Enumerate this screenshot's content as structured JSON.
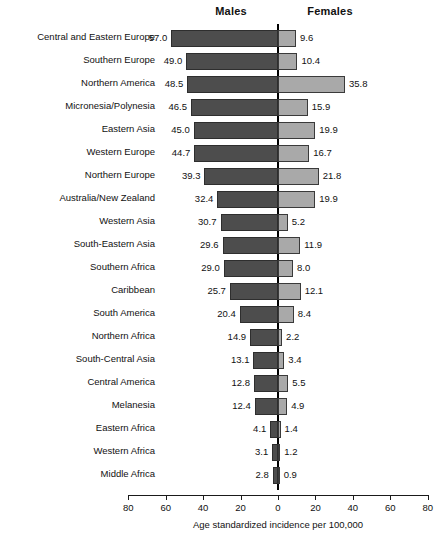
{
  "headers": {
    "males": "Males",
    "females": "Females"
  },
  "axis": {
    "title": "Age standardized incidence per 100,000",
    "tick_labels": [
      "80",
      "60",
      "40",
      "20",
      "0",
      "20",
      "40",
      "60",
      "80"
    ],
    "tick_values": [
      -80,
      -60,
      -40,
      -20,
      0,
      20,
      40,
      60,
      80
    ],
    "max": 80,
    "step": 20
  },
  "colors": {
    "male_bar": "#4d4d4d",
    "female_bar": "#a9a9a9",
    "bar_outline": "#2e2e2e",
    "axis": "#1a1a1a",
    "text": "#111111",
    "background": "#ffffff"
  },
  "chart_data": {
    "type": "bar",
    "title": "",
    "subtitle": "",
    "orientation": "horizontal",
    "layout": "diverging-population-pyramid",
    "xlabel": "Age standardized incidence per 100,000",
    "ylabel": "",
    "xlim": [
      -80,
      80
    ],
    "xticks": [
      -80,
      -60,
      -40,
      -20,
      0,
      20,
      40,
      60,
      80
    ],
    "xtick_labels": [
      "80",
      "60",
      "40",
      "20",
      "0",
      "20",
      "40",
      "60",
      "80"
    ],
    "grid": false,
    "legend_position": "top",
    "categories": [
      "Central and Eastern Europe",
      "Southern Europe",
      "Northern America",
      "Micronesia/Polynesia",
      "Eastern Asia",
      "Western Europe",
      "Northern Europe",
      "Australia/New Zealand",
      "Western Asia",
      "South-Eastern Asia",
      "Southern Africa",
      "Caribbean",
      "South America",
      "Northern Africa",
      "South-Central Asia",
      "Central America",
      "Melanesia",
      "Eastern Africa",
      "Western Africa",
      "Middle Africa"
    ],
    "series": [
      {
        "name": "Males",
        "side": "left",
        "values": [
          57.0,
          49.0,
          48.5,
          46.5,
          45.0,
          44.7,
          39.3,
          32.4,
          30.7,
          29.6,
          29.0,
          25.7,
          20.4,
          14.9,
          13.1,
          12.8,
          12.4,
          4.1,
          3.1,
          2.8
        ],
        "labels": [
          "57.0",
          "49.0",
          "48.5",
          "46.5",
          "45.0",
          "44.7",
          "39.3",
          "32.4",
          "30.7",
          "29.6",
          "29.0",
          "25.7",
          "20.4",
          "14.9",
          "13.1",
          "12.8",
          "12.4",
          "4.1",
          "3.1",
          "2.8"
        ]
      },
      {
        "name": "Females",
        "side": "right",
        "values": [
          9.6,
          10.4,
          35.8,
          15.9,
          19.9,
          16.7,
          21.8,
          19.9,
          5.2,
          11.9,
          8.0,
          12.1,
          8.4,
          2.2,
          3.4,
          5.5,
          4.9,
          1.4,
          1.2,
          0.9
        ],
        "labels": [
          "9.6",
          "10.4",
          "35.8",
          "15.9",
          "19.9",
          "16.7",
          "21.8",
          "19.9",
          "5.2",
          "11.9",
          "8.0",
          "12.1",
          "8.4",
          "2.2",
          "3.4",
          "5.5",
          "4.9",
          "1.4",
          "1.2",
          "0.9"
        ]
      }
    ]
  }
}
